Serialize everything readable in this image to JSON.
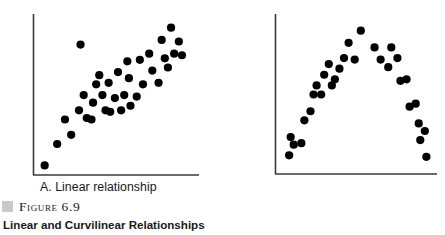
{
  "figure": {
    "marker_color": "#c9c9c9",
    "number_label": "Figure 6.9",
    "title": "Linear and Curvilinear Relationships"
  },
  "panels": {
    "a": {
      "caption": "A. Linear relationship"
    },
    "b": {
      "caption": "B. Curvilinear relationship"
    }
  },
  "chart_data": [
    {
      "type": "scatter",
      "id": "panel-a",
      "title": "A. Linear relationship",
      "xlabel": "",
      "ylabel": "",
      "grid": false,
      "legend": false,
      "axis_style": "left-and-bottom-spine-only",
      "xlim": [
        0,
        100
      ],
      "ylim": [
        0,
        100
      ],
      "marker": {
        "shape": "circle",
        "color": "#000000",
        "size": 5
      },
      "points": [
        {
          "x": 3,
          "y": 3
        },
        {
          "x": 11,
          "y": 17
        },
        {
          "x": 16,
          "y": 33
        },
        {
          "x": 20,
          "y": 23
        },
        {
          "x": 25,
          "y": 39
        },
        {
          "x": 26,
          "y": 82
        },
        {
          "x": 28,
          "y": 49
        },
        {
          "x": 30,
          "y": 34
        },
        {
          "x": 33,
          "y": 33
        },
        {
          "x": 34,
          "y": 44
        },
        {
          "x": 36,
          "y": 56
        },
        {
          "x": 38,
          "y": 62
        },
        {
          "x": 40,
          "y": 49
        },
        {
          "x": 42,
          "y": 39
        },
        {
          "x": 44,
          "y": 57
        },
        {
          "x": 45,
          "y": 38
        },
        {
          "x": 48,
          "y": 47
        },
        {
          "x": 50,
          "y": 64
        },
        {
          "x": 52,
          "y": 39
        },
        {
          "x": 54,
          "y": 49
        },
        {
          "x": 56,
          "y": 71
        },
        {
          "x": 57,
          "y": 60
        },
        {
          "x": 58,
          "y": 42
        },
        {
          "x": 62,
          "y": 48
        },
        {
          "x": 64,
          "y": 72
        },
        {
          "x": 66,
          "y": 56
        },
        {
          "x": 70,
          "y": 76
        },
        {
          "x": 72,
          "y": 65
        },
        {
          "x": 76,
          "y": 57
        },
        {
          "x": 78,
          "y": 85
        },
        {
          "x": 80,
          "y": 73
        },
        {
          "x": 82,
          "y": 67
        },
        {
          "x": 84,
          "y": 93
        },
        {
          "x": 86,
          "y": 76
        },
        {
          "x": 89,
          "y": 84
        },
        {
          "x": 91,
          "y": 75
        }
      ]
    },
    {
      "type": "scatter",
      "id": "panel-b",
      "title": "B. Curvilinear relationship",
      "xlabel": "",
      "ylabel": "",
      "grid": false,
      "legend": false,
      "axis_style": "left-and-bottom-spine-only",
      "xlim": [
        0,
        100
      ],
      "ylim": [
        0,
        100
      ],
      "marker": {
        "shape": "circle",
        "color": "#000000",
        "size": 5
      },
      "points": [
        {
          "x": 5,
          "y": 9
        },
        {
          "x": 6,
          "y": 21
        },
        {
          "x": 8,
          "y": 16
        },
        {
          "x": 13,
          "y": 17
        },
        {
          "x": 15,
          "y": 32
        },
        {
          "x": 19,
          "y": 38
        },
        {
          "x": 21,
          "y": 49
        },
        {
          "x": 23,
          "y": 55
        },
        {
          "x": 26,
          "y": 49
        },
        {
          "x": 28,
          "y": 62
        },
        {
          "x": 31,
          "y": 69
        },
        {
          "x": 33,
          "y": 55
        },
        {
          "x": 35,
          "y": 59
        },
        {
          "x": 38,
          "y": 66
        },
        {
          "x": 41,
          "y": 73
        },
        {
          "x": 44,
          "y": 83
        },
        {
          "x": 48,
          "y": 72
        },
        {
          "x": 52,
          "y": 91
        },
        {
          "x": 61,
          "y": 80
        },
        {
          "x": 65,
          "y": 72
        },
        {
          "x": 70,
          "y": 67
        },
        {
          "x": 72,
          "y": 80
        },
        {
          "x": 76,
          "y": 73
        },
        {
          "x": 78,
          "y": 58
        },
        {
          "x": 82,
          "y": 59
        },
        {
          "x": 84,
          "y": 41
        },
        {
          "x": 88,
          "y": 43
        },
        {
          "x": 90,
          "y": 30
        },
        {
          "x": 91,
          "y": 19
        },
        {
          "x": 94,
          "y": 25
        },
        {
          "x": 95,
          "y": 8
        }
      ]
    }
  ]
}
